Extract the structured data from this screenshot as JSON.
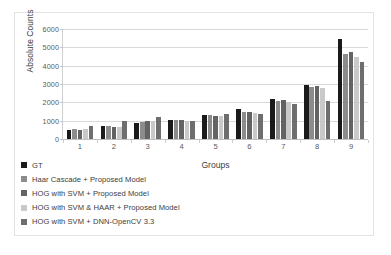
{
  "chart_data": {
    "type": "bar",
    "title": "",
    "xlabel": "Groups",
    "ylabel": "Absolute Counts",
    "categories": [
      "1",
      "2",
      "3",
      "4",
      "5",
      "6",
      "7",
      "8",
      "9"
    ],
    "ylim": [
      0,
      6000
    ],
    "ytick_labels": [
      "0",
      "1000",
      "2000",
      "3000",
      "4000",
      "5000",
      "6000"
    ],
    "ytick_values": [
      0,
      1000,
      2000,
      3000,
      4000,
      5000,
      6000
    ],
    "grid": true,
    "legend_position": "below-left",
    "series": [
      {
        "name": "GT",
        "color": "#1a1a1a",
        "values": [
          470,
          720,
          870,
          1020,
          1290,
          1650,
          2180,
          2950,
          5430
        ]
      },
      {
        "name": "Haar Cascade + Proposed Model",
        "color": "#8c8c8c",
        "values": [
          530,
          690,
          950,
          1010,
          1300,
          1490,
          2080,
          2820,
          4620
        ]
      },
      {
        "name": "HOG with SVM + Proposed Model",
        "color": "#636363",
        "values": [
          490,
          660,
          960,
          1010,
          1270,
          1470,
          2150,
          2870,
          4760
        ]
      },
      {
        "name": "HOG with SVM & HAAR + Proposed Model",
        "color": "#c9c9c9",
        "values": [
          520,
          660,
          990,
          1000,
          1240,
          1440,
          2030,
          2800,
          4450
        ]
      },
      {
        "name": "HOG with SVM + DNN-OpenCV 3.3",
        "color": "#6e6e6e",
        "values": [
          700,
          1000,
          1210,
          1000,
          1360,
          1390,
          1900,
          2090,
          4190
        ]
      }
    ]
  }
}
